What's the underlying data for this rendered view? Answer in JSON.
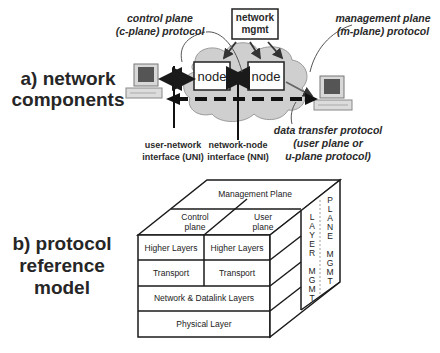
{
  "section_a": {
    "title_line1": "a) network",
    "title_line2": "components",
    "nodes": [
      "node",
      "node"
    ],
    "network_mgmt": {
      "line1": "network",
      "line2": "mgmt"
    },
    "annotations": {
      "control_plane_line1": "control plane",
      "control_plane_line2": "(c-plane) protocol",
      "management_plane_line1": "management plane",
      "management_plane_line2": "(m-plane) protocol",
      "data_transfer_line1": "data transfer protocol",
      "data_transfer_line2": "(user plane or",
      "data_transfer_line3": "u-plane protocol)",
      "uni_line1": "user-network",
      "uni_line2": "interface (UNI)",
      "nni_line1": "network-node",
      "nni_line2": "interface (NNI)"
    }
  },
  "section_b": {
    "title_line1": "b) protocol",
    "title_line2": "reference",
    "title_line3": "model",
    "top_face": "Management Plane",
    "control_plane_line1": "Control",
    "control_plane_line2": "plane",
    "user_plane_line1": "User",
    "user_plane_line2": "plane",
    "layers": {
      "higher_left": "Higher Layers",
      "higher_right": "Higher Layers",
      "transport_left": "Transport",
      "transport_right": "Transport",
      "network_datalink": "Network & Datalink Layers",
      "physical": "Physical Layer"
    },
    "layer_mgmt": [
      "L",
      "A",
      "Y",
      "E",
      "R",
      "",
      "M",
      "G",
      "M",
      "T"
    ],
    "plane_mgmt": [
      "P",
      "L",
      "A",
      "N",
      "E",
      "",
      "M",
      "G",
      "M",
      "T"
    ]
  }
}
